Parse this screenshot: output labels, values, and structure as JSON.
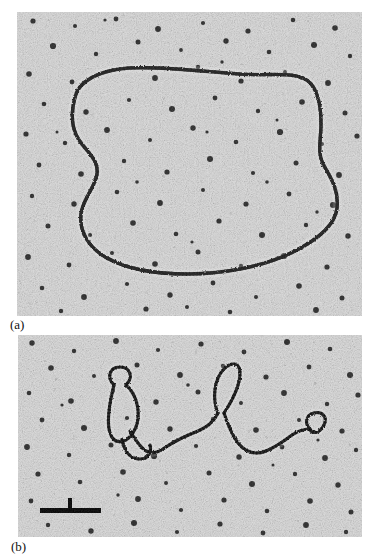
{
  "figure": {
    "kind": "electron-micrograph-figure",
    "panels": [
      {
        "id": "a",
        "label": "(a)",
        "subject": "circular DNA molecule",
        "specimen_shape": "closed circle",
        "background_tone": "#d2d2d2",
        "filament_color": "#1e1e1e",
        "scale_bar": null
      },
      {
        "id": "b",
        "label": "(b)",
        "subject": "branched / looped linear DNA molecule",
        "specimen_shape": "open strand with three loops",
        "background_tone": "#d2d2d2",
        "filament_color": "#1e1e1e",
        "scale_bar": {
          "present": true,
          "orientation": "horizontal with central vertical tick",
          "label": "",
          "x_start": 40,
          "x_end": 101,
          "y": 511,
          "thickness": 5,
          "color": "#000000"
        }
      }
    ],
    "colors": {
      "page_background": "#ffffff",
      "grain_light": "#e8e8e8",
      "grain_dark": "#2a2a2a",
      "filament": "#1e1e1e",
      "text": "#111111"
    }
  }
}
